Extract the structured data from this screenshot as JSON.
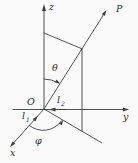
{
  "figure": {
    "background_color": "#fafafa",
    "line_color": "#3f3f3f",
    "text_color": "#2e2e2e",
    "labels": {
      "z_axis": "z",
      "y_axis": "y",
      "x_axis": "x",
      "point": "P",
      "origin": "O",
      "theta": "θ",
      "phi": "φ",
      "l1_base": "l",
      "l1_sub": "1",
      "l2_base": "l",
      "l2_sub": "2"
    }
  }
}
